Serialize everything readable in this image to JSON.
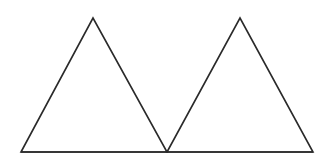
{
  "diagram": {
    "background": "#ffffff",
    "stroke_color": "#2a2a2a",
    "stroke_width": 1.6,
    "shapes": [
      {
        "id": "triangle-left",
        "type": "triangle",
        "points": [
          [
            21,
            152
          ],
          [
            93,
            18
          ],
          [
            167,
            152
          ]
        ]
      },
      {
        "id": "triangle-right",
        "type": "triangle",
        "points": [
          [
            167,
            152
          ],
          [
            240,
            18
          ],
          [
            313,
            152
          ]
        ]
      }
    ],
    "baseline": {
      "x1": 21,
      "y1": 152,
      "x2": 313,
      "y2": 152
    }
  }
}
